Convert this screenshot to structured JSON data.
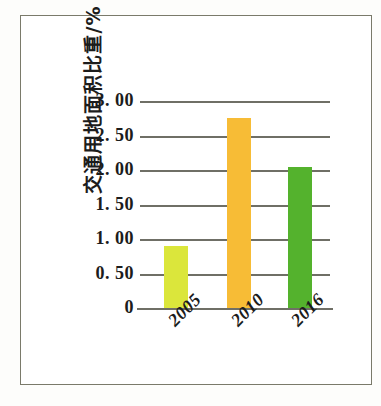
{
  "chart_data": {
    "type": "bar",
    "title": "",
    "subtitle": "",
    "xlabel": "",
    "ylabel": "交通用地面积比重/%",
    "categories": [
      "2005",
      "2010",
      "2016"
    ],
    "values": [
      0.9,
      2.75,
      2.05
    ],
    "series": [
      {
        "name": "交通用地面积比重",
        "values": [
          0.9,
          2.75,
          2.05
        ]
      }
    ],
    "ylim": [
      0,
      3.0
    ],
    "ytick_values": [
      3.0,
      2.5,
      2.0,
      1.5,
      1.0,
      0.5,
      0
    ],
    "ytick_labels": [
      "3. 00",
      "2. 50",
      "2. 00",
      "1. 50",
      "1. 00",
      "0. 50",
      "0"
    ],
    "grid": true,
    "grid_axis": "y",
    "legend": false,
    "legend_position": "none",
    "bar_colors": [
      "#dbe63b",
      "#f7bc36",
      "#54b22d"
    ],
    "gridline_color": "#6f6f66",
    "axis_text_color": "#1c1c1c",
    "frame_color": "#7a7a6a",
    "background_color": "#ffffff",
    "xtick_rotation": -45
  }
}
